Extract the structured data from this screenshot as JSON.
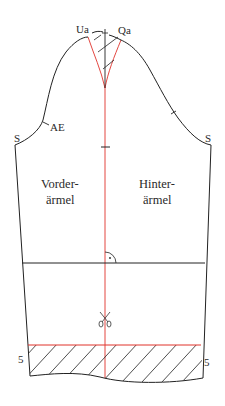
{
  "diagram": {
    "colors": {
      "outline": "#222222",
      "construction_red": "#e0322b",
      "background": "#ffffff"
    },
    "labels": {
      "ua": "Ua",
      "qa": "Qa",
      "ae": "AE",
      "s_left": "S",
      "s_right": "S",
      "front_line1": "Vorder-",
      "front_line2": "ärmel",
      "back_line1": "Hinter-",
      "back_line2": "ärmel",
      "hem_left": "5",
      "hem_right": "5"
    },
    "icons": {
      "scissors": "scissors-icon",
      "right_angle": "right-angle-icon"
    }
  }
}
